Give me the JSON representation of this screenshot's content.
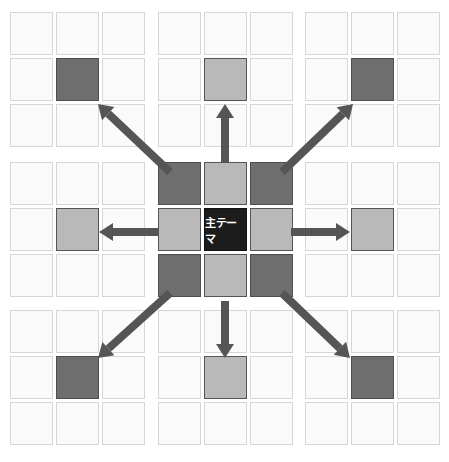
{
  "diagram": {
    "type": "mandala-chart-expansion",
    "center_label": "主テーマ",
    "colors": {
      "background": "#ffffff",
      "empty_cell": "#fafafa",
      "empty_border": "#d6d6d6",
      "dark_cell": "#6e6e6e",
      "light_cell": "#b9b9b9",
      "theme_cell": "#1c1c1c",
      "arrow": "#555555"
    },
    "block_origins_x": [
      10,
      158,
      305
    ],
    "block_origins_y": [
      12,
      162,
      310
    ],
    "cell_size": 43,
    "cell_pitch": 46,
    "blocks": [
      {
        "row": 0,
        "col": 0,
        "center_shade": "dark"
      },
      {
        "row": 0,
        "col": 1,
        "center_shade": "light"
      },
      {
        "row": 0,
        "col": 2,
        "center_shade": "dark"
      },
      {
        "row": 1,
        "col": 0,
        "center_shade": "light"
      },
      {
        "row": 1,
        "col": 1,
        "center_shade": "theme"
      },
      {
        "row": 1,
        "col": 2,
        "center_shade": "light"
      },
      {
        "row": 2,
        "col": 0,
        "center_shade": "dark"
      },
      {
        "row": 2,
        "col": 1,
        "center_shade": "light"
      },
      {
        "row": 2,
        "col": 2,
        "center_shade": "dark"
      }
    ],
    "center_block_ring": [
      "dark",
      "light",
      "dark",
      "light",
      "light",
      "dark",
      "light",
      "dark"
    ],
    "arrows": [
      {
        "direction": "up-left",
        "target_block": "top-left"
      },
      {
        "direction": "up",
        "target_block": "top-center"
      },
      {
        "direction": "up-right",
        "target_block": "top-right"
      },
      {
        "direction": "left",
        "target_block": "middle-left"
      },
      {
        "direction": "right",
        "target_block": "middle-right"
      },
      {
        "direction": "down-left",
        "target_block": "bottom-left"
      },
      {
        "direction": "down",
        "target_block": "bottom-center"
      },
      {
        "direction": "down-right",
        "target_block": "bottom-right"
      }
    ]
  }
}
